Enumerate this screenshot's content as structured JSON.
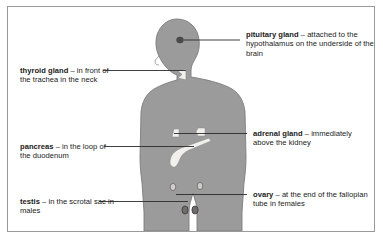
{
  "figure": {
    "panel_border_color": "#9a9a9a",
    "background_color": "#ffffff",
    "body_fill_color": "#9b9b9b",
    "body_outline_color": "#7d7d7d",
    "organ_light_color": "#f2f0ec",
    "organ_dark_color": "#4d4d4d",
    "leader_line_color": "#2b2b2b"
  },
  "callouts": {
    "thyroid": {
      "term": "thyroid gland",
      "description": " – in front of the trachea in the neck",
      "organ_name": "thyroid-gland",
      "side": "left"
    },
    "pancreas": {
      "term": "pancreas",
      "description": " – in the loop of the duodenum",
      "organ_name": "pancreas",
      "side": "left"
    },
    "testis": {
      "term": "testis",
      "description": " – in the scrotal sac in males",
      "organ_name": "testis",
      "side": "left"
    },
    "pituitary": {
      "term": "pituitary gland",
      "description": " – attached to the hypothalamus on the underside of the brain",
      "organ_name": "pituitary-gland",
      "side": "right"
    },
    "adrenal": {
      "term": "adrenal gland",
      "description": " – immediately above the kidney",
      "organ_name": "adrenal-gland",
      "side": "right"
    },
    "ovary": {
      "term": "ovary",
      "description": " – at the end of the fallopian tube in females",
      "organ_name": "ovary",
      "side": "right"
    }
  }
}
